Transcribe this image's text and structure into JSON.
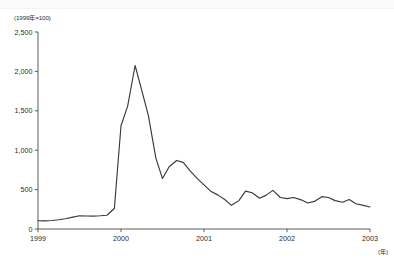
{
  "chart_data": {
    "type": "line",
    "title": "",
    "subtitle": "",
    "unit_label": "(1999年=100)",
    "xlabel": "(年)",
    "ylabel": "",
    "xlim": [
      1999.0,
      2003.0
    ],
    "ylim": [
      0,
      2500
    ],
    "grid": false,
    "legend": null,
    "x_tick_labels": [
      "1999",
      "2000",
      "2001",
      "2002",
      "2003"
    ],
    "x_tick_values": [
      1999,
      2000,
      2001,
      2002,
      2003
    ],
    "y_tick_labels": [
      "0",
      "500",
      "1,000",
      "1,500",
      "2,000",
      "2,500"
    ],
    "y_tick_values": [
      0,
      500,
      1000,
      1500,
      2000,
      2500
    ],
    "series": [
      {
        "name": "index",
        "color": "#3a3a3a",
        "x": [
          1999.0,
          1999.08,
          1999.17,
          1999.25,
          1999.33,
          1999.42,
          1999.5,
          1999.58,
          1999.67,
          1999.75,
          1999.83,
          1999.92,
          2000.0,
          2000.08,
          2000.17,
          2000.25,
          2000.33,
          2000.42,
          2000.5,
          2000.58,
          2000.67,
          2000.75,
          2000.83,
          2000.92,
          2001.0,
          2001.08,
          2001.17,
          2001.25,
          2001.33,
          2001.42,
          2001.5,
          2001.58,
          2001.67,
          2001.75,
          2001.83,
          2001.92,
          2002.0,
          2002.08,
          2002.17,
          2002.25,
          2002.33,
          2002.42,
          2002.5,
          2002.58,
          2002.67,
          2002.75,
          2002.83,
          2002.92,
          2003.0
        ],
        "values": [
          105,
          103,
          108,
          118,
          130,
          150,
          168,
          165,
          163,
          168,
          175,
          260,
          1310,
          1560,
          2075,
          1760,
          1440,
          900,
          640,
          790,
          870,
          845,
          740,
          640,
          560,
          480,
          430,
          375,
          300,
          360,
          480,
          460,
          390,
          430,
          490,
          400,
          385,
          400,
          370,
          330,
          350,
          410,
          400,
          360,
          340,
          375,
          320,
          300,
          280
        ]
      }
    ],
    "annotations": [],
    "peak": {
      "x": 2000.17,
      "value": 2075
    },
    "secondary_peak": {
      "x": 2000.67,
      "value": 870
    },
    "final_value": 280
  },
  "axes": {
    "y_axis_name": "value-axis",
    "x_axis_name": "time-axis"
  }
}
